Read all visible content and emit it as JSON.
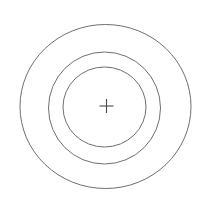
{
  "figure": {
    "background_color": "#ffffff",
    "width": 209,
    "height": 198,
    "stroke_color": "#6f6f6f",
    "crosshair_color": "#4a4a4a"
  },
  "chart_data": {
    "type": "scatter",
    "subtitle": "",
    "xlabel": "",
    "ylabel": "",
    "xlim": [
      0,
      209
    ],
    "ylim": [
      0,
      198
    ],
    "grid": false,
    "legend": false,
    "legend_position": "none",
    "annotations": [],
    "center": {
      "label": "center-crosshair",
      "x": 106.5,
      "y": 106,
      "marker": "plus",
      "arm_length": 7,
      "color": "#4a4a4a",
      "stroke_width": 1.1
    },
    "series": [
      {
        "name": "outer-ring",
        "shape": "ellipse",
        "cx": 105.5,
        "cy": 106.5,
        "rx": 85.5,
        "ry": 82,
        "color": "#6f6f6f",
        "stroke_width": 1
      },
      {
        "name": "middle-ring",
        "shape": "ellipse",
        "cx": 104.5,
        "cy": 108,
        "rx": 56,
        "ry": 56,
        "color": "#6f6f6f",
        "stroke_width": 1
      },
      {
        "name": "inner-ring",
        "shape": "ellipse",
        "cx": 104.5,
        "cy": 107,
        "rx": 41.5,
        "ry": 40,
        "color": "#6f6f6f",
        "stroke_width": 1
      }
    ]
  }
}
